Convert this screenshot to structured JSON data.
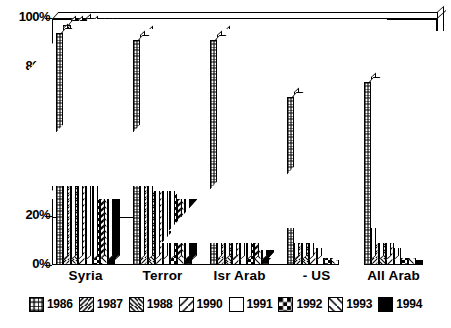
{
  "chart_data": {
    "type": "bar",
    "title": "",
    "subtitle": "",
    "xlabel": "",
    "ylabel": "",
    "ylim": [
      0,
      100
    ],
    "ytick_values": [
      0,
      20,
      40,
      60,
      80,
      100
    ],
    "ytick_labels": [
      "0%",
      "20%",
      "40%",
      "60%",
      "80%",
      "100%"
    ],
    "grid": true,
    "grid_axis": "y",
    "legend_position": "bottom",
    "value_suffix": "%",
    "categories": [
      "Syria",
      "Terror",
      "Isr Arab",
      "- US",
      "All Arab"
    ],
    "series": [
      {
        "name": "1986",
        "pattern": "grid",
        "color": "#ffffff",
        "values": [
          94,
          91,
          91,
          68,
          74
        ]
      },
      {
        "name": "1987",
        "pattern": "diagonal",
        "color": "#ffffff",
        "values": [
          97,
          93,
          93,
          73,
          76
        ]
      },
      {
        "name": "1988",
        "pattern": "back-diagonal",
        "color": "#ffffff",
        "values": [
          97,
          92,
          89,
          70,
          69
        ]
      },
      {
        "name": "1990",
        "pattern": "single-slash",
        "color": "#ffffff",
        "values": [
          98,
          93,
          90,
          69,
          66
        ]
      },
      {
        "name": "1991",
        "pattern": "empty",
        "color": "#ffffff",
        "values": [
          97,
          92,
          91,
          72,
          62
        ]
      },
      {
        "name": "1992",
        "pattern": "checker",
        "color": "#ffffff",
        "values": [
          96,
          86,
          88,
          74,
          63
        ]
      },
      {
        "name": "1993",
        "pattern": "single-backslash",
        "color": "#ffffff",
        "values": [
          96,
          86,
          88,
          65,
          61
        ]
      },
      {
        "name": "1994",
        "pattern": "solid",
        "color": "#000000",
        "values": [
          94,
          87,
          89,
          66,
          58
        ]
      }
    ]
  },
  "legend": {
    "items": [
      {
        "label": "1986"
      },
      {
        "label": "1987"
      },
      {
        "label": "1988"
      },
      {
        "label": "1990"
      },
      {
        "label": "1991"
      },
      {
        "label": "1992"
      },
      {
        "label": "1993"
      },
      {
        "label": "1994"
      }
    ]
  },
  "colors": {
    "foreground": "#000000",
    "background": "#ffffff"
  }
}
